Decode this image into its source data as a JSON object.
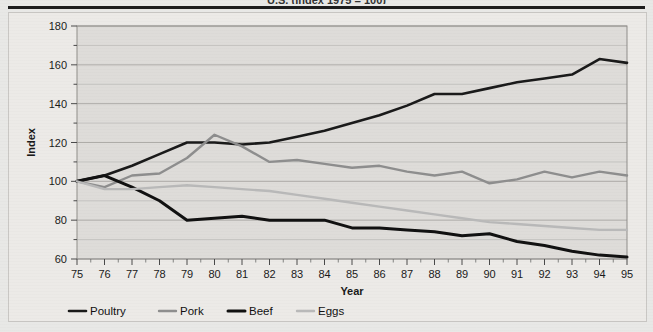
{
  "figure": {
    "title_clipped": "U.S. (index 1975 = 100)",
    "background_color": "#e8e8e6",
    "plot_background_color": "#dedcd9"
  },
  "legend": {
    "position": "bottom",
    "entries": [
      {
        "label": "Poultry",
        "color": "#1a1a1a",
        "width": 2.6
      },
      {
        "label": "Pork",
        "color": "#8e8e8e",
        "width": 2.4
      },
      {
        "label": "Beef",
        "color": "#111111",
        "width": 3.0
      },
      {
        "label": "Eggs",
        "color": "#b9b9b9",
        "width": 2.4
      }
    ]
  },
  "chart_data": {
    "type": "line",
    "title": "",
    "xlabel": "Year",
    "ylabel": "Index",
    "grid": true,
    "legend_position": "bottom",
    "xlim": [
      75,
      95
    ],
    "ylim": [
      60,
      180
    ],
    "ytick_step": 20,
    "yminor_step": 10,
    "x": [
      75,
      76,
      77,
      78,
      79,
      80,
      81,
      82,
      83,
      84,
      85,
      86,
      87,
      88,
      89,
      90,
      91,
      92,
      93,
      94,
      95
    ],
    "xticklabels": [
      "75",
      "76",
      "77",
      "78",
      "79",
      "80",
      "81",
      "82",
      "83",
      "84",
      "85",
      "86",
      "87",
      "88",
      "89",
      "90",
      "91",
      "92",
      "93",
      "94",
      "95"
    ],
    "yticklabels": [
      "60",
      "80",
      "100",
      "120",
      "140",
      "160",
      "180"
    ],
    "series": [
      {
        "name": "Poultry",
        "color": "#1a1a1a",
        "values": [
          100,
          103,
          108,
          114,
          120,
          120,
          119,
          120,
          123,
          126,
          130,
          134,
          139,
          145,
          145,
          148,
          151,
          153,
          155,
          163,
          161
        ]
      },
      {
        "name": "Pork",
        "color": "#8e8e8e",
        "values": [
          100,
          97,
          103,
          104,
          112,
          124,
          118,
          110,
          111,
          109,
          107,
          108,
          105,
          103,
          105,
          99,
          101,
          105,
          102,
          105,
          103
        ]
      },
      {
        "name": "Beef",
        "color": "#111111",
        "values": [
          100,
          103,
          97,
          90,
          80,
          81,
          82,
          80,
          80,
          80,
          76,
          76,
          75,
          74,
          72,
          73,
          69,
          67,
          64,
          62,
          61
        ]
      },
      {
        "name": "Eggs",
        "color": "#b9b9b9",
        "values": [
          100,
          96,
          96,
          97,
          98,
          97,
          96,
          95,
          93,
          91,
          89,
          87,
          85,
          83,
          81,
          79,
          78,
          77,
          76,
          75,
          75
        ]
      }
    ]
  }
}
